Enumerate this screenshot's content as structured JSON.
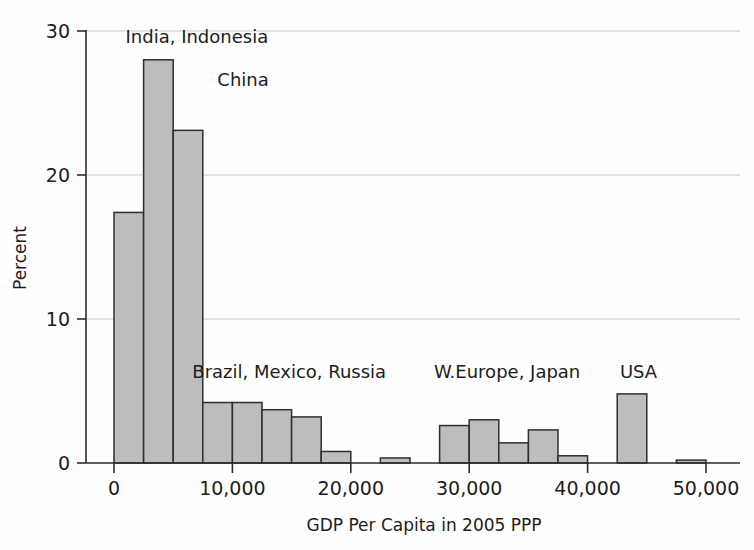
{
  "chart_data": {
    "type": "bar",
    "title": "",
    "subtitle": "",
    "xlabel": "GDP Per Capita in 2005 PPP",
    "ylabel": "Percent",
    "xlim": [
      -2500,
      52000
    ],
    "ylim": [
      0,
      30
    ],
    "xticks": [
      0,
      10000,
      20000,
      30000,
      40000,
      50000
    ],
    "xtick_labels": [
      "0",
      "10,000",
      "20,000",
      "30,000",
      "40,000",
      "50,000"
    ],
    "yticks": [
      0,
      10,
      20,
      30
    ],
    "ytick_labels": [
      "0",
      "10",
      "20",
      "30"
    ],
    "grid": "horizontal",
    "legend": "none",
    "bin_width": 2500,
    "bar_color": "#bdbdbd",
    "bar_edge_color": "#2e2e2e",
    "bins": [
      {
        "x0": 0,
        "x1": 2500,
        "value": 17.4
      },
      {
        "x0": 2500,
        "x1": 5000,
        "value": 28.0
      },
      {
        "x0": 5000,
        "x1": 7500,
        "value": 23.1
      },
      {
        "x0": 7500,
        "x1": 10000,
        "value": 4.2
      },
      {
        "x0": 10000,
        "x1": 12500,
        "value": 4.2
      },
      {
        "x0": 12500,
        "x1": 15000,
        "value": 3.7
      },
      {
        "x0": 15000,
        "x1": 17500,
        "value": 3.2
      },
      {
        "x0": 17500,
        "x1": 20000,
        "value": 0.8
      },
      {
        "x0": 20000,
        "x1": 22500,
        "value": 0.0
      },
      {
        "x0": 22500,
        "x1": 25000,
        "value": 0.35
      },
      {
        "x0": 25000,
        "x1": 27500,
        "value": 0.0
      },
      {
        "x0": 27500,
        "x1": 30000,
        "value": 2.6
      },
      {
        "x0": 30000,
        "x1": 32500,
        "value": 3.0
      },
      {
        "x0": 32500,
        "x1": 35000,
        "value": 1.4
      },
      {
        "x0": 35000,
        "x1": 37500,
        "value": 2.3
      },
      {
        "x0": 37500,
        "x1": 40000,
        "value": 0.5
      },
      {
        "x0": 40000,
        "x1": 42500,
        "value": 0.0
      },
      {
        "x0": 42500,
        "x1": 45000,
        "value": 4.8
      },
      {
        "x0": 45000,
        "x1": 47500,
        "value": 0.0
      },
      {
        "x0": 47500,
        "x1": 50000,
        "value": 0.2
      }
    ],
    "annotations": [
      {
        "text": "India, Indonesia",
        "x": 7000,
        "y": 29.2,
        "anchor": "middle"
      },
      {
        "text": "China",
        "x": 10900,
        "y": 26.2,
        "anchor": "middle"
      },
      {
        "text": "Brazil, Mexico, Russia",
        "x": 14800,
        "y": 5.9,
        "anchor": "middle"
      },
      {
        "text": "W.Europe, Japan",
        "x": 33200,
        "y": 5.9,
        "anchor": "middle"
      },
      {
        "text": "USA",
        "x": 44300,
        "y": 5.9,
        "anchor": "middle"
      }
    ]
  }
}
